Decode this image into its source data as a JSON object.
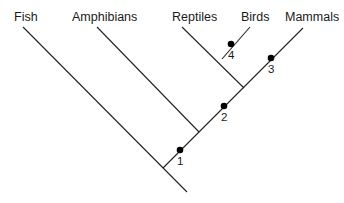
{
  "diagram": {
    "type": "cladogram",
    "taxa": [
      {
        "name": "Fish",
        "x": 14,
        "y": 21
      },
      {
        "name": "Amphibians",
        "x": 72,
        "y": 21
      },
      {
        "name": "Reptiles",
        "x": 172,
        "y": 21
      },
      {
        "name": "Birds",
        "x": 241,
        "y": 21
      },
      {
        "name": "Mammals",
        "x": 285,
        "y": 21
      }
    ],
    "nodes": [
      {
        "label": "1",
        "dot_x": 180,
        "dot_y": 150,
        "label_x": 177,
        "label_y": 165
      },
      {
        "label": "2",
        "dot_x": 224,
        "dot_y": 106,
        "label_x": 221,
        "label_y": 121
      },
      {
        "label": "3",
        "dot_x": 271,
        "dot_y": 58,
        "label_x": 268,
        "label_y": 73
      },
      {
        "label": "4",
        "dot_x": 231,
        "dot_y": 44,
        "label_x": 228,
        "label_y": 59
      }
    ],
    "branches": [
      {
        "name": "fish-branch",
        "x1": 23,
        "y1": 27,
        "x2": 187,
        "y2": 192
      },
      {
        "name": "main-trunk",
        "x1": 163,
        "y1": 168,
        "x2": 303,
        "y2": 28
      },
      {
        "name": "amphibians-branch",
        "x1": 97,
        "y1": 27,
        "x2": 199,
        "y2": 132
      },
      {
        "name": "reptiles-branch",
        "x1": 182,
        "y1": 27,
        "x2": 244,
        "y2": 88
      },
      {
        "name": "birds-branch",
        "x1": 250,
        "y1": 27,
        "x2": 222,
        "y2": 59
      }
    ]
  }
}
